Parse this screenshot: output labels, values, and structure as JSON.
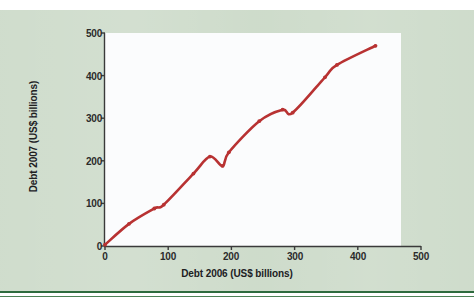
{
  "figure": {
    "background_color": "#cddbca",
    "plot_background_color": "#fbfcfd",
    "rule_color": "#2e6b3e",
    "series_color": "#b83232"
  },
  "chart_data": {
    "type": "line",
    "title": "",
    "subtitle": "",
    "xlabel": "Debt 2006 (US$ billions)",
    "ylabel": "Debt 2007 (US$ billions)",
    "xlim": [
      0,
      500
    ],
    "ylim": [
      0,
      500
    ],
    "xticks": [
      0,
      100,
      200,
      300,
      400,
      500
    ],
    "yticks": [
      0,
      100,
      200,
      300,
      400,
      500
    ],
    "xtick_labels": [
      "0",
      "100",
      "200",
      "300",
      "400",
      "500"
    ],
    "ytick_labels": [
      "0",
      "100",
      "200",
      "300",
      "400",
      "500"
    ],
    "grid": false,
    "legend": null,
    "legend_position": "none",
    "markers": true,
    "series": [
      {
        "name": "Debt 2007 vs Debt 2006",
        "color": "#b83232",
        "x": [
          0,
          38,
          78,
          93,
          140,
          166,
          186,
          196,
          244,
          281,
          297,
          348,
          367,
          428
        ],
        "y": [
          3,
          52,
          88,
          97,
          170,
          210,
          188,
          220,
          293,
          320,
          313,
          396,
          425,
          470
        ]
      }
    ],
    "annotations": [
      {
        "text": "curve backtracks near x=166-186",
        "x": 176,
        "y": 199
      },
      {
        "text": "curve backtracks near x=281-297",
        "x": 289,
        "y": 316
      }
    ]
  }
}
